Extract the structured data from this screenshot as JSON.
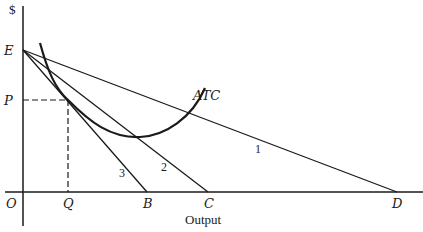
{
  "diagram": {
    "y_axis_label": "$",
    "x_axis_label": "Output",
    "origin_label": "O",
    "points": {
      "E": "E",
      "P": "P",
      "Q": "Q",
      "B": "B",
      "C": "C",
      "D": "D"
    },
    "curve_label": "ATC",
    "lines": [
      {
        "id": "1",
        "label": "1",
        "from": "E",
        "to": "D"
      },
      {
        "id": "2",
        "label": "2",
        "from": "E",
        "to": "C"
      },
      {
        "id": "3",
        "label": "3",
        "from": "E",
        "to": "B"
      }
    ],
    "colors": {
      "ink": "#1a1a1a",
      "background": "#ffffff"
    }
  }
}
